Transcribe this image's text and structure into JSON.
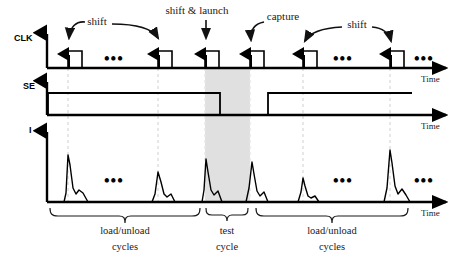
{
  "figure": {
    "background_color": "#ffffff",
    "ink_color": "#000000",
    "shade_color": "#e0e0e0",
    "guide_color": "#d8d8d8"
  },
  "waveforms": [
    {
      "name": "clk",
      "label": "CLK",
      "axis_label": "Time",
      "baseline_y": 68,
      "axis_x": 47,
      "axis_top_y": 30,
      "axis_end_x": 450,
      "pulse_height": 17,
      "pulse_width": 14,
      "pulses_x": [
        68,
        158,
        205,
        250,
        303,
        390
      ],
      "rising_edge_arrows": true
    },
    {
      "name": "se",
      "label": "SE",
      "axis_label": "Time",
      "baseline_y": 115,
      "axis_x": 47,
      "axis_top_y": 78,
      "axis_end_x": 450,
      "high_level_y": 93,
      "segments": [
        {
          "start_x": 48,
          "end_x": 220,
          "level": "high"
        },
        {
          "start_x": 220,
          "end_x": 268,
          "level": "low"
        },
        {
          "start_x": 268,
          "end_x": 412,
          "level": "high"
        }
      ]
    },
    {
      "name": "i",
      "label": "I",
      "axis_label": "Time",
      "baseline_y": 202,
      "axis_x": 47,
      "axis_top_y": 128,
      "axis_end_x": 450,
      "spikes": [
        {
          "x": 68,
          "height": 47,
          "label": "load/unload spike"
        },
        {
          "x": 158,
          "height": 30,
          "label": "load/unload spike"
        },
        {
          "x": 207,
          "height": 43,
          "label": "launch spike"
        },
        {
          "x": 252,
          "height": 40,
          "label": "capture spike"
        },
        {
          "x": 303,
          "height": 24,
          "label": "load/unload spike"
        },
        {
          "x": 390,
          "height": 52,
          "label": "load/unload spike"
        }
      ]
    }
  ],
  "shaded_region": {
    "name": "test-cycle-shading",
    "start_x": 205,
    "end_x": 250,
    "top_y": 68,
    "bottom_y": 202,
    "color": "#e0e0e0"
  },
  "guide_lines_x": [
    68,
    158,
    205,
    250,
    303,
    390
  ],
  "annotations": [
    {
      "name": "shift-left",
      "text": "shift",
      "text_x": 119,
      "text_y": 22,
      "arrow_to_x": 70,
      "arrow_to_y": 44
    },
    {
      "name": "shift-right",
      "text": "",
      "text_x": 0,
      "text_y": 0,
      "arrow_to_x": 160,
      "arrow_to_y": 44
    },
    {
      "name": "shift-and-launch",
      "text": "shift & launch",
      "text_x": 197,
      "text_y": 14,
      "arrow_to_x": 207,
      "arrow_to_y": 44
    },
    {
      "name": "capture",
      "text": "capture",
      "text_x": 283,
      "text_y": 20,
      "arrow_to_x": 252,
      "arrow_to_y": 44
    },
    {
      "name": "shift-second",
      "text": "shift",
      "text_x": 357,
      "text_y": 26,
      "arrow_to_x": 305,
      "arrow_to_y": 46
    }
  ],
  "ellipses": [
    {
      "name": "clk-ellipsis-left",
      "x": 112,
      "y": 64
    },
    {
      "name": "clk-ellipsis-right",
      "x": 340,
      "y": 64
    },
    {
      "name": "clk-ellipsis-end",
      "x": 420,
      "y": 64
    },
    {
      "name": "i-ellipsis-left",
      "x": 112,
      "y": 185
    },
    {
      "name": "i-ellipsis-right",
      "x": 340,
      "y": 185
    },
    {
      "name": "i-ellipsis-end",
      "x": 420,
      "y": 185
    }
  ],
  "brackets": [
    {
      "name": "load-unload-cycles-left",
      "start_x": 50,
      "end_x": 200,
      "y": 208,
      "line1": "load/unload",
      "line2": "cycles",
      "label_x": 125,
      "label_y1": 231,
      "label_y2": 248
    },
    {
      "name": "test-cycle",
      "start_x": 206,
      "end_x": 248,
      "y": 208,
      "line1": "test",
      "line2": "cycle",
      "label_x": 227,
      "label_y1": 231,
      "label_y2": 248
    },
    {
      "name": "load-unload-cycles-right",
      "start_x": 256,
      "end_x": 408,
      "y": 208,
      "line1": "load/unload",
      "line2": "cycles",
      "label_x": 332,
      "label_y1": 231,
      "label_y2": 248
    }
  ],
  "time_labels": [
    {
      "name": "clk-time-label",
      "text": "Time",
      "x": 421,
      "y": 82
    },
    {
      "name": "se-time-label",
      "text": "Time",
      "x": 421,
      "y": 129
    },
    {
      "name": "i-time-label",
      "text": "Time",
      "x": 421,
      "y": 216
    }
  ]
}
